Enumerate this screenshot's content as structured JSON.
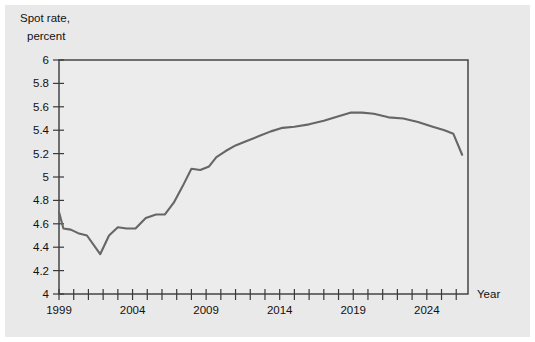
{
  "figure": {
    "background_color": "#e9e9e9",
    "page_color": "#ffffff",
    "plot_background_color": "#ececec",
    "axis_color": "#3a3a3a",
    "line_color": "#666666"
  },
  "labels": {
    "ylabel_line1": "Spot rate,",
    "ylabel_line2": "percent",
    "xlabel": "Year"
  },
  "chart_data": {
    "type": "line",
    "title": "",
    "subtitle": "",
    "xlabel": "Year",
    "ylabel": "Spot rate, percent",
    "xlim": [
      1999,
      2026.8
    ],
    "ylim": [
      4,
      6
    ],
    "grid": false,
    "legend": null,
    "y_ticks": [
      4,
      4.2,
      4.4,
      4.6,
      4.8,
      5,
      5.2,
      5.4,
      5.6,
      5.8,
      6
    ],
    "y_tick_labels": [
      "4",
      "4.2",
      "4.4",
      "4.6",
      "4.8",
      "5",
      "5.2",
      "5.4",
      "5.6",
      "5.8",
      "6"
    ],
    "x_ticks": [
      1999,
      2000,
      2001,
      2002,
      2003,
      2004,
      2005,
      2006,
      2007,
      2008,
      2009,
      2010,
      2011,
      2012,
      2013,
      2014,
      2015,
      2016,
      2017,
      2018,
      2019,
      2020,
      2021,
      2022,
      2023,
      2024,
      2025,
      2026
    ],
    "x_tick_labels_shown": [
      "1999",
      "2004",
      "2009",
      "2014",
      "2019",
      "2024"
    ],
    "x_tick_labels_years": [
      1999,
      2004,
      2009,
      2014,
      2019,
      2024
    ],
    "series": [
      {
        "name": "Spot rate",
        "x": [
          1999.0,
          1999.3,
          1999.8,
          2000.3,
          2000.9,
          2001.8,
          2002.4,
          2003.0,
          2003.6,
          2004.2,
          2004.9,
          2005.6,
          2006.2,
          2006.8,
          2007.4,
          2008.0,
          2008.6,
          2009.2,
          2009.7,
          2010.3,
          2011.0,
          2011.8,
          2012.6,
          2013.4,
          2014.2,
          2015.0,
          2016.0,
          2017.0,
          2018.0,
          2018.8,
          2019.6,
          2020.4,
          2021.4,
          2022.4,
          2023.4,
          2024.4,
          2025.2,
          2025.8,
          2026.4
        ],
        "y": [
          4.7,
          4.56,
          4.55,
          4.52,
          4.5,
          4.34,
          4.5,
          4.57,
          4.56,
          4.56,
          4.65,
          4.68,
          4.68,
          4.78,
          4.92,
          5.07,
          5.06,
          5.09,
          5.17,
          5.22,
          5.27,
          5.31,
          5.35,
          5.39,
          5.42,
          5.43,
          5.45,
          5.48,
          5.52,
          5.55,
          5.55,
          5.54,
          5.51,
          5.5,
          5.47,
          5.43,
          5.4,
          5.37,
          5.19
        ]
      }
    ]
  }
}
